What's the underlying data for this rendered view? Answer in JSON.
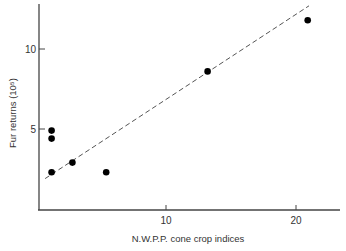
{
  "chart_data": {
    "type": "scatter",
    "title": "",
    "xlabel": "N.W.P.P. cone crop indices",
    "ylabel": "Fur returns (10⁵)",
    "xlim": [
      0,
      23.5
    ],
    "ylim": [
      0,
      12.8
    ],
    "x_ticks": [
      10,
      20
    ],
    "x_tick_labels": [
      "10",
      "20"
    ],
    "y_ticks": [
      5,
      10
    ],
    "y_tick_labels": [
      "5",
      "10"
    ],
    "grid": false,
    "legend": null,
    "series": [
      {
        "name": "observations",
        "marker": "filled-circle",
        "points": [
          {
            "x": 1.2,
            "y": 4.9
          },
          {
            "x": 1.2,
            "y": 4.4
          },
          {
            "x": 1.2,
            "y": 2.3
          },
          {
            "x": 2.8,
            "y": 2.9
          },
          {
            "x": 5.4,
            "y": 2.3
          },
          {
            "x": 13.2,
            "y": 8.6
          },
          {
            "x": 20.9,
            "y": 11.8
          }
        ]
      },
      {
        "name": "regression line",
        "style": "dashed",
        "points": [
          {
            "x": 0.7,
            "y": 1.9
          },
          {
            "x": 21.0,
            "y": 12.7
          }
        ]
      }
    ]
  }
}
